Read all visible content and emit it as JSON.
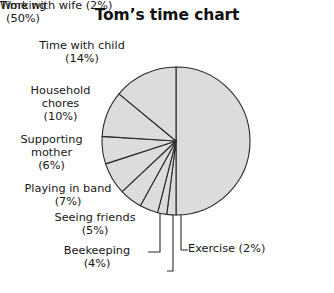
{
  "chart": {
    "title": "Tom’s time chart",
    "fill_color": "#dcdcdc",
    "stroke_color": "#2b2b2b",
    "background_color": "#ffffff"
  },
  "chart_data": {
    "type": "pie",
    "title": "Tom’s time chart",
    "xlabel": "",
    "ylabel": "",
    "legend_position": "none",
    "grid": false,
    "labels": [
      "Working",
      "Time with wife",
      "Exercise",
      "Beekeeping",
      "Seeing friends",
      "Playing in band",
      "Supporting mother",
      "Household chores",
      "Time with child"
    ],
    "values": [
      50,
      2,
      2,
      4,
      5,
      7,
      6,
      10,
      14
    ],
    "unit": "%",
    "start_angle_deg": 0,
    "direction": "clockwise",
    "slices": [
      {
        "label": "Working",
        "value": 50,
        "pct_text": "(50%)",
        "label_text": "Working",
        "full_text": "Working (50%)",
        "callout": false
      },
      {
        "label": "Time with wife",
        "value": 2,
        "pct_text": "(2%)",
        "label_text": "Time with wife",
        "full_text": "Time with wife (2%)",
        "callout": true
      },
      {
        "label": "Exercise",
        "value": 2,
        "pct_text": "(2%)",
        "label_text": "Exercise",
        "full_text": "Exercise (2%)",
        "callout": true
      },
      {
        "label": "Beekeeping",
        "value": 4,
        "pct_text": "(4%)",
        "label_text": "Beekeeping",
        "full_text": "Beekeeping (4%)",
        "callout": true
      },
      {
        "label": "Seeing friends",
        "value": 5,
        "pct_text": "(5%)",
        "label_text": "Seeing friends",
        "full_text": "Seeing friends (5%)",
        "callout": false
      },
      {
        "label": "Playing in band",
        "value": 7,
        "pct_text": "(7%)",
        "label_text": "Playing in band",
        "full_text": "Playing in band (7%)",
        "callout": false
      },
      {
        "label": "Supporting mother",
        "value": 6,
        "pct_text": "(6%)",
        "label_text": "Supporting mother",
        "full_text": "Supporting mother (6%)",
        "callout": false
      },
      {
        "label": "Household chores",
        "value": 10,
        "pct_text": "(10%)",
        "label_text": "Household chores",
        "full_text": "Household chores (10%)",
        "callout": false
      },
      {
        "label": "Time with child",
        "value": 14,
        "pct_text": "(14%)",
        "label_text": "Time with child",
        "full_text": "Time with child (14%)",
        "callout": false
      }
    ],
    "geometry": {
      "cx": 176,
      "cy": 141,
      "r": 74
    }
  },
  "labels": {
    "working": {
      "line1": "Working",
      "line2": "(50%)"
    },
    "time_wife": {
      "text": "Time with wife (2%)"
    },
    "exercise": {
      "text": "Exercise (2%)"
    },
    "beekeeping": {
      "line1": "Beekeeping",
      "line2": "(4%)"
    },
    "seeing": {
      "line1": "Seeing friends",
      "line2": "(5%)"
    },
    "playing": {
      "line1": "Playing in band",
      "line2": "(7%)"
    },
    "supporting": {
      "line1": "Supporting",
      "line2": "mother",
      "line3": "(6%)"
    },
    "household": {
      "line1": "Household",
      "line2": "chores",
      "line3": "(10%)"
    },
    "time_child": {
      "line1": "Time with child",
      "line2": "(14%)"
    }
  }
}
